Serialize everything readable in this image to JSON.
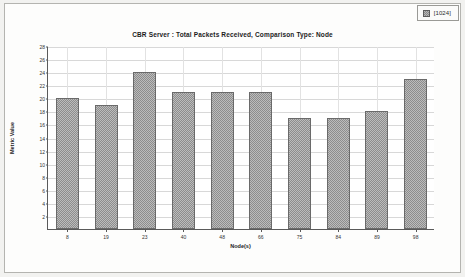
{
  "legend": {
    "swatch_name": "series-swatch",
    "label": "[1024]",
    "swatch_color": "#8d8d8d"
  },
  "chart_data": {
    "type": "bar",
    "title": "CBR Server :  Total Packets Received, Comparison Type: Node",
    "xlabel": "Node(s)",
    "ylabel": "Metric Value",
    "categories": [
      "8",
      "19",
      "23",
      "40",
      "48",
      "66",
      "75",
      "84",
      "89",
      "98"
    ],
    "values": [
      20,
      19,
      24,
      21,
      21,
      21,
      17,
      17,
      18,
      23
    ],
    "series": [
      {
        "name": "[1024]",
        "values": [
          20,
          19,
          24,
          21,
          21,
          21,
          17,
          17,
          18,
          23
        ]
      }
    ],
    "ylim": [
      0,
      28
    ],
    "ytick_labels": [
      "2",
      "4",
      "6",
      "8",
      "10",
      "12",
      "14",
      "16",
      "18",
      "20",
      "22",
      "24",
      "26",
      "28"
    ],
    "ytick_values": [
      2,
      4,
      6,
      8,
      10,
      12,
      14,
      16,
      18,
      20,
      22,
      24,
      26,
      28
    ],
    "grid": true,
    "legend_position": "top-right",
    "bar_color": "#8d8d8d",
    "bar_border_color": "#6a6a6a",
    "gridline_color": "#d8d8d8",
    "axis_color": "#5a5a5a",
    "plot_background": "#ffffff",
    "page_background": "#f2f2f0"
  }
}
